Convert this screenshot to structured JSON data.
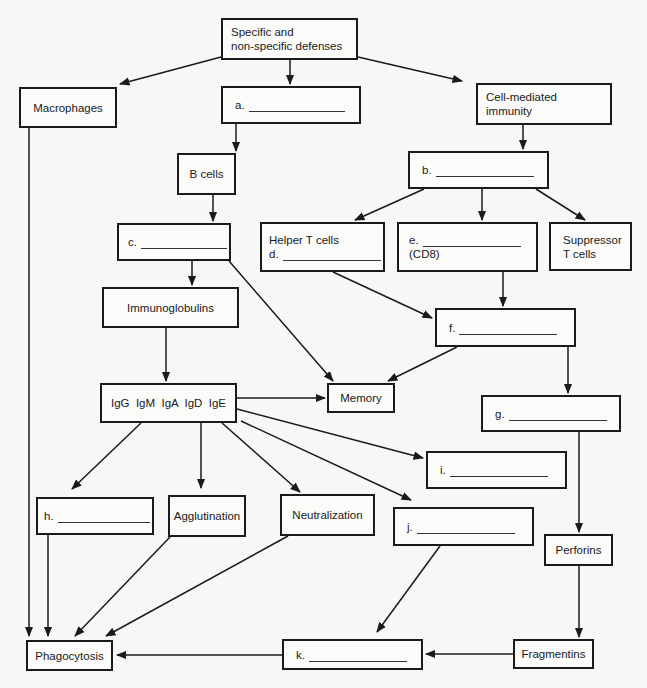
{
  "diagram": {
    "colors": {
      "stroke": "#1a1a1a",
      "background": "#f7f7f5",
      "box_fill": "#fbfbfa"
    },
    "nodes": {
      "root": {
        "line1": "Specific and",
        "line2": "non-specific defenses"
      },
      "macrophages": {
        "label": "Macrophages"
      },
      "a": {
        "prefix": "a.",
        "blank": true
      },
      "cell_mediated": {
        "line1": "Cell-mediated",
        "line2": "immunity"
      },
      "b_cells": {
        "label": "B cells"
      },
      "b": {
        "prefix": "b.",
        "blank": true
      },
      "c": {
        "prefix": "c.",
        "blank": true
      },
      "helper_t": {
        "line1": "Helper T cells",
        "prefix": "d.",
        "blank": true
      },
      "e": {
        "prefix": "e.",
        "line2": "(CD8)",
        "blank": true
      },
      "suppressor": {
        "line1": "Suppressor",
        "line2": "T cells"
      },
      "immunoglobulins": {
        "label": "Immunoglobulins"
      },
      "f": {
        "prefix": "f.",
        "blank": true
      },
      "ig_classes": {
        "label": "IgG  IgM  IgA  IgD  IgE"
      },
      "memory": {
        "label": "Memory"
      },
      "g": {
        "prefix": "g.",
        "blank": true
      },
      "i": {
        "prefix": "i.",
        "blank": true
      },
      "h": {
        "prefix": "h.",
        "blank": true
      },
      "agglutination": {
        "label": "Agglutination"
      },
      "neutralization": {
        "label": "Neutralization"
      },
      "j": {
        "prefix": "j.",
        "blank": true
      },
      "perforins": {
        "label": "Perforins"
      },
      "phagocytosis": {
        "label": "Phagocytosis"
      },
      "k": {
        "prefix": "k.",
        "blank": true
      },
      "fragmentins": {
        "label": "Fragmentins"
      }
    },
    "edges": [
      [
        "root",
        "macrophages"
      ],
      [
        "root",
        "a"
      ],
      [
        "root",
        "cell_mediated"
      ],
      [
        "a",
        "b_cells"
      ],
      [
        "b_cells",
        "c"
      ],
      [
        "c",
        "immunoglobulins"
      ],
      [
        "c",
        "memory"
      ],
      [
        "cell_mediated",
        "b"
      ],
      [
        "b",
        "helper_t"
      ],
      [
        "b",
        "e"
      ],
      [
        "b",
        "suppressor"
      ],
      [
        "helper_t",
        "f"
      ],
      [
        "e",
        "f"
      ],
      [
        "f",
        "memory"
      ],
      [
        "f",
        "g"
      ],
      [
        "immunoglobulins",
        "ig_classes"
      ],
      [
        "ig_classes",
        "memory"
      ],
      [
        "ig_classes",
        "i"
      ],
      [
        "ig_classes",
        "h"
      ],
      [
        "ig_classes",
        "agglutination"
      ],
      [
        "ig_classes",
        "neutralization"
      ],
      [
        "ig_classes",
        "j"
      ],
      [
        "g",
        "perforins"
      ],
      [
        "perforins",
        "fragmentins"
      ],
      [
        "fragmentins",
        "k"
      ],
      [
        "k",
        "phagocytosis"
      ],
      [
        "j",
        "k"
      ],
      [
        "macrophages",
        "phagocytosis"
      ],
      [
        "h",
        "phagocytosis"
      ],
      [
        "agglutination",
        "phagocytosis"
      ],
      [
        "neutralization",
        "phagocytosis"
      ]
    ]
  }
}
